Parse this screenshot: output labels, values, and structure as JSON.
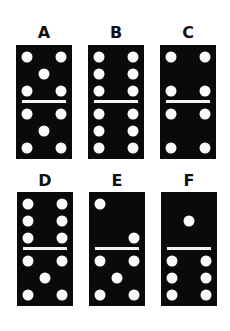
{
  "dominoes": [
    {
      "label": "A",
      "top": 5,
      "bottom": 5,
      "x": 16,
      "y": 45
    },
    {
      "label": "B",
      "top": 6,
      "bottom": 6,
      "x": 88,
      "y": 45
    },
    {
      "label": "C",
      "top": 4,
      "bottom": 4,
      "x": 160,
      "y": 45
    },
    {
      "label": "D",
      "top": 6,
      "bottom": 5,
      "x": 17,
      "y": 192
    },
    {
      "label": "E",
      "top": 2,
      "bottom": 5,
      "x": 89,
      "y": 192
    },
    {
      "label": "F",
      "top": 1,
      "bottom": 6,
      "x": 161,
      "y": 192
    }
  ],
  "colors": {
    "domino": "#0a0a0a",
    "pip": "#fafafa",
    "background": "#ffffff"
  }
}
